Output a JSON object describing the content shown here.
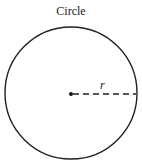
{
  "diagram": {
    "title": "Circle",
    "radius_label": "r",
    "shape": "circle",
    "center": {
      "x": 71,
      "y": 93
    },
    "radius_px": 66,
    "stroke_color": "#222222",
    "background_color": "#ffffff"
  }
}
